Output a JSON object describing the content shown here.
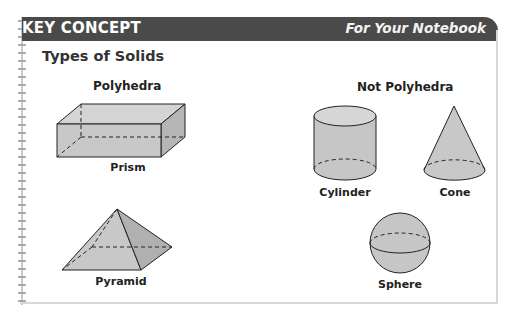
{
  "header": {
    "left_label": "KEY CONCEPT",
    "right_label": "For Your Notebook",
    "bar_color": "#4a4a4a"
  },
  "title": "Types of Solids",
  "sections": {
    "polyhedra": {
      "heading": "Polyhedra",
      "items": [
        {
          "name": "Prism",
          "icon": "rectangular-prism-icon"
        },
        {
          "name": "Pyramid",
          "icon": "square-pyramid-icon"
        }
      ]
    },
    "not_polyhedra": {
      "heading": "Not Polyhedra",
      "items": [
        {
          "name": "Cylinder",
          "icon": "cylinder-icon"
        },
        {
          "name": "Cone",
          "icon": "cone-icon"
        },
        {
          "name": "Sphere",
          "icon": "sphere-icon"
        }
      ]
    }
  },
  "colors": {
    "shape_fill": "#c9c9c9",
    "shape_fill_dark": "#b0b0b0",
    "stroke": "#222222"
  }
}
